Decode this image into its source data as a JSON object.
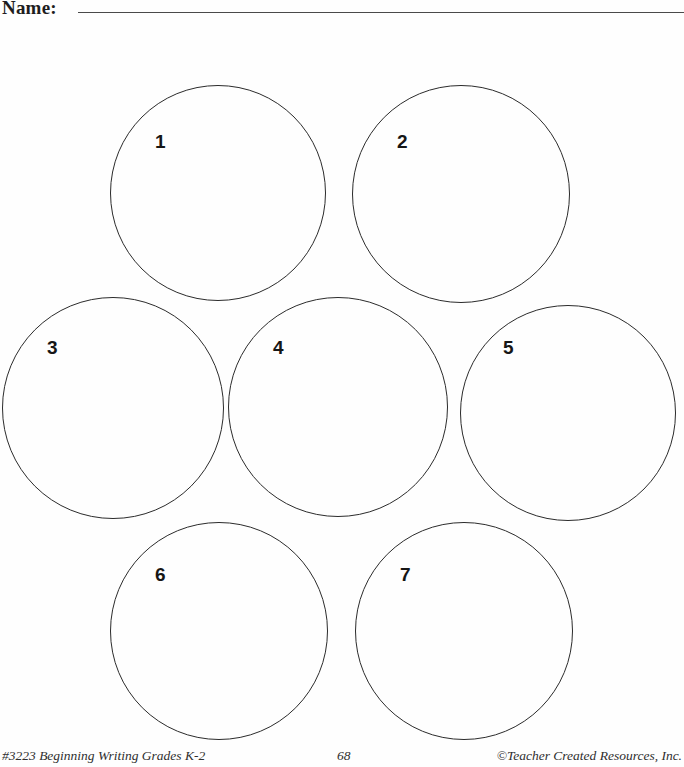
{
  "header": {
    "name_label": "Name:",
    "line_name": "name-write-line"
  },
  "worksheet": {
    "circle_count": 7,
    "stroke_color": "#2b2b2b",
    "background_color": "#fefefe",
    "circles": [
      {
        "label": "1",
        "left": 110,
        "top": 85,
        "size": 216,
        "num_left": 44,
        "num_top": 46
      },
      {
        "label": "2",
        "left": 352,
        "top": 85,
        "size": 218,
        "num_left": 44,
        "num_top": 46
      },
      {
        "label": "3",
        "left": 2,
        "top": 297,
        "size": 222,
        "num_left": 44,
        "num_top": 40
      },
      {
        "label": "4",
        "left": 228,
        "top": 297,
        "size": 220,
        "num_left": 44,
        "num_top": 40
      },
      {
        "label": "5",
        "left": 460,
        "top": 305,
        "size": 216,
        "num_left": 42,
        "num_top": 32
      },
      {
        "label": "6",
        "left": 110,
        "top": 522,
        "size": 218,
        "num_left": 44,
        "num_top": 42
      },
      {
        "label": "7",
        "left": 355,
        "top": 522,
        "size": 218,
        "num_left": 44,
        "num_top": 42
      }
    ]
  },
  "footer": {
    "left_text": "#3223 Beginning Writing Grades K-2",
    "page_number": "68",
    "right_text": "©Teacher Created Resources, Inc."
  }
}
